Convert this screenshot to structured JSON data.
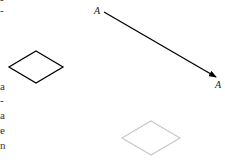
{
  "left_text_fragments": [
    "-",
    "-",
    "a",
    "-",
    "a",
    "e",
    "n"
  ],
  "labels": {
    "arrow_start": "A",
    "arrow_end": "A"
  },
  "shapes": {
    "black_diamond": {
      "stroke": "#000000"
    },
    "grey_diamond": {
      "stroke": "#c8c8c8"
    },
    "arrow": {
      "stroke": "#000000"
    }
  }
}
